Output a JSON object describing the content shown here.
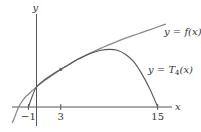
{
  "chart_data": {
    "type": "line",
    "title": "",
    "xlabel": "x",
    "ylabel": "y",
    "xlim": [
      -4,
      16.5
    ],
    "ylim": [
      -2,
      11
    ],
    "x_ticks": [
      -1,
      3,
      15
    ],
    "x_tick_labels": [
      "−1",
      "3",
      "15"
    ],
    "grid": false,
    "marked_point": {
      "x": 3,
      "y": 4.7
    },
    "series": [
      {
        "name": "y = f(x)",
        "label_parts": {
          "pre": "y = ",
          "fn": "f",
          "arg": "(x)"
        },
        "points": [
          [
            -3.0,
            -2.0
          ],
          [
            -2.6,
            -1.0
          ],
          [
            -2.2,
            0.0
          ],
          [
            -1.5,
            1.1
          ],
          [
            -1.0,
            1.6
          ],
          [
            0.0,
            2.5
          ],
          [
            1.0,
            3.3
          ],
          [
            2.0,
            4.0
          ],
          [
            3.0,
            4.7
          ],
          [
            4.0,
            5.3
          ],
          [
            5.0,
            5.9
          ],
          [
            6.0,
            6.4
          ],
          [
            7.0,
            6.9
          ],
          [
            8.0,
            7.35
          ],
          [
            9.0,
            7.8
          ],
          [
            10.0,
            8.2
          ],
          [
            11.0,
            8.6
          ],
          [
            12.0,
            8.95
          ],
          [
            13.0,
            9.3
          ],
          [
            14.0,
            9.65
          ],
          [
            15.0,
            10.0
          ],
          [
            16.0,
            10.35
          ]
        ]
      },
      {
        "name": "y = T4(x)",
        "label_parts": {
          "pre": "y = ",
          "fn": "T",
          "sub": "4",
          "arg": "(x)"
        },
        "points": [
          [
            -1.0,
            0.0
          ],
          [
            -0.5,
            1.4
          ],
          [
            0.0,
            2.5
          ],
          [
            1.0,
            3.4
          ],
          [
            2.0,
            4.1
          ],
          [
            3.0,
            4.7
          ],
          [
            4.0,
            5.3
          ],
          [
            5.0,
            5.9
          ],
          [
            6.0,
            6.4
          ],
          [
            7.0,
            6.8
          ],
          [
            8.0,
            7.1
          ],
          [
            9.0,
            7.2
          ],
          [
            10.0,
            7.1
          ],
          [
            11.0,
            6.6
          ],
          [
            12.0,
            5.7
          ],
          [
            13.0,
            4.2
          ],
          [
            14.0,
            2.3
          ],
          [
            15.0,
            0.0
          ]
        ]
      }
    ]
  }
}
